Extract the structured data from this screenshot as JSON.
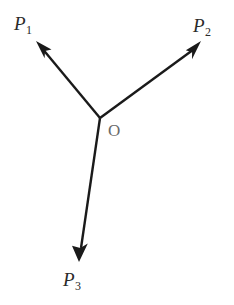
{
  "figure": {
    "type": "vector-diagram",
    "background_color": "#ffffff",
    "stroke_color": "#1a1a1a",
    "label_color": "#2a2a2a",
    "origin_label_color": "#6a6a6a",
    "stroke_width": 2.4,
    "canvas": {
      "width": 234,
      "height": 305
    },
    "origin": {
      "name": "O",
      "label": "O",
      "x": 100,
      "y": 118,
      "label_x": 108,
      "label_y": 122
    },
    "vectors": [
      {
        "id": "p1",
        "label_base": "P",
        "label_subscript": "1",
        "label_text": "P1",
        "from_x": 100,
        "from_y": 118,
        "to_x": 36,
        "to_y": 41,
        "arrowhead": "solid-triangle",
        "label_x": 14,
        "label_y": 14
      },
      {
        "id": "p2",
        "label_base": "P",
        "label_subscript": "2",
        "label_text": "P2",
        "from_x": 100,
        "from_y": 118,
        "to_x": 201,
        "to_y": 41,
        "arrowhead": "solid-triangle",
        "label_x": 193,
        "label_y": 16
      },
      {
        "id": "p3",
        "label_base": "P",
        "label_subscript": "3",
        "label_text": "P3",
        "from_x": 100,
        "from_y": 118,
        "to_x": 79,
        "to_y": 262,
        "arrowhead": "solid-triangle",
        "label_x": 63,
        "label_y": 270
      }
    ]
  }
}
